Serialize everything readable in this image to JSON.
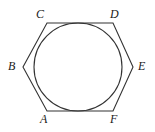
{
  "figure": {
    "kind": "geometry-diagram",
    "background_color": "#ffffff",
    "stroke_color": "#333333",
    "label_color": "#1a1a1a",
    "canvas": {
      "width": 155,
      "height": 132
    },
    "circle": {
      "name": "inscribed-circle",
      "cx": 78,
      "cy": 67,
      "r": 44,
      "stroke": "#333333",
      "stroke_width": 1.1,
      "fill": "none"
    },
    "polygon": {
      "name": "hexagon-abcdef",
      "stroke": "#333333",
      "stroke_width": 1.1,
      "fill": "none",
      "points": "47,23 113,23 133,67 113,111 47,111 23,67"
    },
    "vertices": [
      {
        "id": "C",
        "label": "C",
        "x": 47,
        "y": 23,
        "label_x": 36,
        "label_y": 8
      },
      {
        "id": "D",
        "label": "D",
        "x": 113,
        "y": 23,
        "label_x": 110,
        "label_y": 8
      },
      {
        "id": "E",
        "label": "E",
        "x": 133,
        "y": 67,
        "label_x": 138,
        "label_y": 60
      },
      {
        "id": "F",
        "label": "F",
        "x": 113,
        "y": 111,
        "label_x": 110,
        "label_y": 113
      },
      {
        "id": "A",
        "label": "A",
        "x": 47,
        "y": 111,
        "label_x": 40,
        "label_y": 113
      },
      {
        "id": "B",
        "label": "B",
        "x": 23,
        "y": 67,
        "label_x": 8,
        "label_y": 60
      }
    ]
  }
}
